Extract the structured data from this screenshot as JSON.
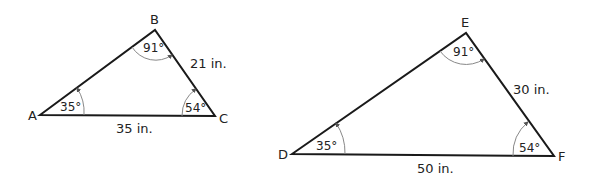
{
  "triangles": [
    {
      "name": "ABC",
      "vertices": {
        "A": "A",
        "B": "B",
        "C": "C"
      },
      "angles": {
        "A": "35°",
        "B": "91°",
        "C": "54°"
      },
      "sides": {
        "BC": "21 in.",
        "AC": "35 in."
      }
    },
    {
      "name": "DEF",
      "vertices": {
        "D": "D",
        "E": "E",
        "F": "F"
      },
      "angles": {
        "D": "35°",
        "E": "91°",
        "F": "54°"
      },
      "sides": {
        "EF": "30 in.",
        "DF": "50 in."
      }
    }
  ]
}
